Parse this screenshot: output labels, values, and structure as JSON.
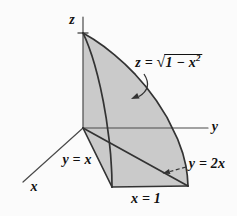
{
  "figure": {
    "description_labels": {
      "z_axis": "z",
      "y_axis": "y",
      "x_axis": "x",
      "line_y_equals_x": "y = x",
      "line_y_equals_2x": "y = 2x",
      "line_x_equals_1": "x = 1",
      "surface_equation": {
        "lhs": "z = ",
        "sqrt_sign": "√",
        "radicand": "1 − x",
        "exponent": "2"
      }
    }
  },
  "colors": {
    "background": "#fbfbfb",
    "fill": "#cacaca",
    "line": "#333333",
    "axis": "#4a4a4a",
    "text": "#111111"
  }
}
